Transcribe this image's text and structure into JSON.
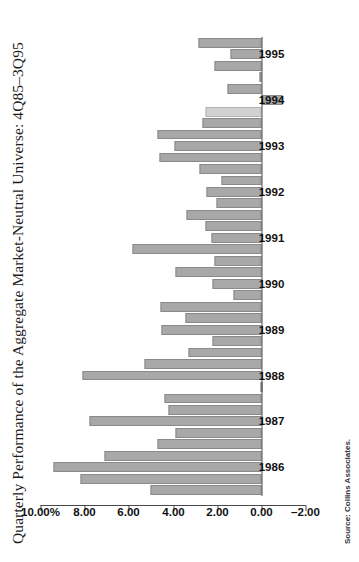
{
  "figure": {
    "title": "Quarterly Performance of the Aggregate Market-Neutral Universe: 4Q85–3Q95",
    "source_note": "Source: Collins Associates.",
    "bar_color": "#a8a8a8",
    "bar_color_highlight": "#d2d2d2",
    "axis_color": "#4a4a4a"
  },
  "chart_data": {
    "type": "bar",
    "title": "Quarterly Performance of the Aggregate Market-Neutral Universe: 4Q85–3Q95",
    "xlabel": "",
    "ylabel": "",
    "ylim": [
      -2.0,
      10.0
    ],
    "ytick_labels": [
      "10.00%",
      "8.00",
      "6.00",
      "4.00",
      "2.00",
      "0.00",
      "–2.00"
    ],
    "ytick_values": [
      10.0,
      8.0,
      6.0,
      4.0,
      2.0,
      0.0,
      -2.0
    ],
    "grid": false,
    "legend": "none",
    "orientation": "horizontal-bars-rotated",
    "year_tick_labels": [
      "1986",
      "1987",
      "1988",
      "1989",
      "1990",
      "1991",
      "1992",
      "1993",
      "1994",
      "1995"
    ],
    "categories": [
      "4Q85",
      "1Q86",
      "2Q86",
      "3Q86",
      "4Q86",
      "1Q87",
      "2Q87",
      "3Q87",
      "4Q87",
      "1Q88",
      "2Q88",
      "3Q88",
      "4Q88",
      "1Q89",
      "2Q89",
      "3Q89",
      "4Q89",
      "1Q90",
      "2Q90",
      "3Q90",
      "4Q90",
      "1Q91",
      "2Q91",
      "3Q91",
      "4Q91",
      "1Q92",
      "2Q92",
      "3Q92",
      "4Q92",
      "1Q93",
      "2Q93",
      "3Q93",
      "4Q93",
      "1Q94",
      "2Q94",
      "3Q94",
      "4Q94",
      "1Q95",
      "2Q95",
      "3Q95"
    ],
    "values": [
      5.0,
      8.2,
      9.4,
      7.1,
      4.7,
      3.9,
      7.8,
      4.2,
      4.4,
      0.05,
      8.1,
      5.3,
      3.3,
      2.2,
      4.5,
      3.45,
      4.55,
      1.25,
      2.2,
      3.9,
      2.1,
      5.85,
      2.25,
      2.55,
      3.4,
      2.05,
      2.5,
      1.8,
      2.8,
      4.6,
      3.95,
      4.7,
      2.65,
      2.55,
      -0.95,
      1.55,
      0.1,
      2.1,
      1.4,
      2.85
    ],
    "highlight_index": 33
  }
}
